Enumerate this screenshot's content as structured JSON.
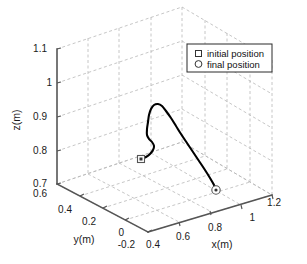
{
  "chart_data": {
    "type": "line",
    "title": "",
    "projection": "3d",
    "xlabel": "x(m)",
    "ylabel": "y(m)",
    "zlabel": "z(m)",
    "xlim": [
      0.4,
      1.2
    ],
    "ylim": [
      -0.2,
      0.6
    ],
    "zlim": [
      0.6,
      1.1
    ],
    "xticks": [
      "0.4",
      "0.6",
      "0.8",
      "1",
      "1.2"
    ],
    "yticks": [
      "0.6",
      "0.4",
      "0.2",
      "0",
      "-0.2"
    ],
    "zticks": [
      "1.1",
      "1",
      "0.9",
      "0.8",
      "0.7",
      "0.6"
    ],
    "grid": true,
    "grid_style": "dashed",
    "grid_color": "#b4b4b4",
    "axis_color": "#4d4d4d",
    "line_color": "#000000",
    "legend_position": "top-right",
    "legend": [
      {
        "label": "initial position",
        "marker": "square"
      },
      {
        "label": "final position",
        "marker": "circle"
      }
    ],
    "markers": [
      {
        "name": "initial position",
        "marker": "square",
        "x": 0.62,
        "y": 0.33,
        "z": 0.78
      },
      {
        "name": "final position",
        "marker": "circle",
        "x": 0.94,
        "y": -0.02,
        "z": 0.7
      }
    ],
    "series": [
      {
        "name": "trajectory",
        "comment": "end-effector path from initial position to final position",
        "points_px": [
          [
            141,
            159
          ],
          [
            146,
            157
          ],
          [
            150,
            154
          ],
          [
            153,
            150
          ],
          [
            154,
            146
          ],
          [
            152,
            142
          ],
          [
            149,
            139
          ],
          [
            147,
            135
          ],
          [
            147,
            129
          ],
          [
            148,
            122
          ],
          [
            149,
            115
          ],
          [
            151,
            109
          ],
          [
            154,
            105
          ],
          [
            158,
            104
          ],
          [
            162,
            106
          ],
          [
            166,
            111
          ],
          [
            171,
            118
          ],
          [
            176,
            126
          ],
          [
            181,
            134
          ],
          [
            187,
            143
          ],
          [
            193,
            152
          ],
          [
            199,
            161
          ],
          [
            205,
            170
          ],
          [
            210,
            178
          ],
          [
            214,
            185
          ],
          [
            216,
            190
          ]
        ]
      }
    ]
  },
  "axes": {
    "z_title": "z(m)",
    "y_title": "y(m)",
    "x_title": "x(m)",
    "z_ticks": [
      {
        "label": "1.1",
        "x": 47,
        "y": 52
      },
      {
        "label": "1",
        "x": 52,
        "y": 86
      },
      {
        "label": "0.9",
        "x": 47,
        "y": 120
      },
      {
        "label": "0.8",
        "x": 47,
        "y": 154
      },
      {
        "label": "0.7",
        "x": 47,
        "y": 187
      },
      {
        "label": "0.6",
        "x": 47,
        "y": 197
      }
    ],
    "y_ticks": [
      {
        "label": "0.4",
        "x": 72,
        "y": 213
      },
      {
        "label": "0.2",
        "x": 96,
        "y": 225
      },
      {
        "label": "0",
        "x": 124,
        "y": 236
      },
      {
        "label": "-0.2",
        "x": 135,
        "y": 248
      }
    ],
    "x_ticks": [
      {
        "label": "0.4",
        "x": 160,
        "y": 248
      },
      {
        "label": "0.6",
        "x": 190,
        "y": 240
      },
      {
        "label": "0.8",
        "x": 222,
        "y": 231
      },
      {
        "label": "1",
        "x": 255,
        "y": 221
      },
      {
        "label": "1.2",
        "x": 281,
        "y": 206
      }
    ]
  },
  "legend": {
    "items": [
      {
        "label": "initial position",
        "marker": "square"
      },
      {
        "label": "final position",
        "marker": "circle"
      }
    ]
  }
}
